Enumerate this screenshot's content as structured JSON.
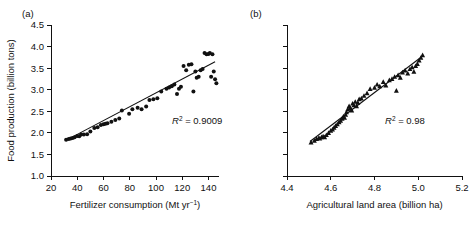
{
  "figure": {
    "panel_a_label": "(a)",
    "panel_b_label": "(b)"
  },
  "chart_data": [
    {
      "type": "scatter",
      "panel": "(a)",
      "title": "",
      "xlabel": "Fertilizer consumption (Mt yr−1)",
      "ylabel": "Food production (billion tons)",
      "xlim": [
        20,
        148
      ],
      "ylim": [
        1.0,
        4.5
      ],
      "xticks": [
        20,
        40,
        60,
        80,
        100,
        120,
        140
      ],
      "xtick_labels": [
        "20",
        "40",
        "60",
        "80",
        "100",
        "120",
        "140"
      ],
      "yticks": [
        1.0,
        1.5,
        2.0,
        2.5,
        3.0,
        3.5,
        4.0,
        4.5
      ],
      "ytick_labels": [
        "1.0",
        "1.5",
        "2.0",
        "2.5",
        "3.0",
        "3.5",
        "4.0",
        "4.5"
      ],
      "grid": false,
      "legend": false,
      "marker": "circle",
      "annotation": "R2 = 0.9009",
      "annotation_r": "R",
      "annotation_sup": "2",
      "annotation_rest": " = 0.9009",
      "r_squared": 0.9009,
      "fit_line": {
        "x0": 31,
        "y0": 1.82,
        "x1": 145,
        "y1": 3.65
      },
      "x": [
        31.5,
        33.5,
        35.0,
        36.5,
        38.0,
        40.0,
        41.5,
        43.0,
        45.0,
        47.5,
        50.0,
        53.0,
        55.5,
        58.0,
        60.0,
        61.5,
        63.0,
        66.0,
        69.0,
        72.0,
        74.0,
        79.5,
        82.0,
        86.0,
        89.0,
        92.5,
        95.0,
        98.0,
        101.0,
        104.0,
        108.0,
        110.0,
        112.0,
        114.0,
        116.0,
        117.5,
        119.0,
        121.0,
        123.0,
        125.0,
        127.0,
        128.5,
        130.0,
        131.0,
        132.5,
        134.0,
        135.5,
        137.0,
        138.5,
        140.0,
        141.0,
        142.0,
        143.0,
        144.0,
        145.0,
        146.0
      ],
      "y": [
        1.84,
        1.86,
        1.87,
        1.88,
        1.9,
        1.93,
        1.92,
        1.96,
        1.96,
        1.97,
        2.03,
        2.11,
        2.13,
        2.18,
        2.2,
        2.21,
        2.22,
        2.26,
        2.3,
        2.33,
        2.52,
        2.44,
        2.55,
        2.58,
        2.55,
        2.61,
        2.76,
        2.78,
        2.8,
        2.96,
        3.02,
        3.05,
        3.08,
        3.12,
        2.9,
        3.02,
        3.07,
        3.55,
        3.45,
        3.58,
        3.59,
        2.96,
        3.42,
        3.28,
        3.3,
        3.45,
        3.48,
        3.85,
        3.82,
        3.83,
        3.85,
        3.3,
        3.82,
        3.42,
        3.24,
        3.15
      ]
    },
    {
      "type": "scatter",
      "panel": "(b)",
      "title": "",
      "xlabel": "Agricultural land area (billion ha)",
      "ylabel": "",
      "xlim": [
        4.4,
        5.2
      ],
      "ylim": [
        1.0,
        4.5
      ],
      "xticks": [
        4.4,
        4.6,
        4.8,
        5.0,
        5.2
      ],
      "xtick_labels": [
        "4.4",
        "4.6",
        "4.8",
        "5.0",
        "5.2"
      ],
      "yticks": [
        1.0,
        1.5,
        2.0,
        2.5,
        3.0,
        3.5,
        4.0,
        4.5
      ],
      "ytick_labels": [
        "",
        "",
        "",
        "",
        "",
        "",
        "",
        ""
      ],
      "grid": false,
      "legend": false,
      "marker": "triangle",
      "annotation": "R2 = 0.98",
      "annotation_r": "R",
      "annotation_sup": "2",
      "annotation_rest": " = 0.98",
      "r_squared": 0.98,
      "fit_line": {
        "x0": 4.505,
        "y0": 1.8,
        "x1": 5.025,
        "y1": 3.8
      },
      "x": [
        4.51,
        4.525,
        4.535,
        4.545,
        4.55,
        4.558,
        4.565,
        4.572,
        4.58,
        4.59,
        4.6,
        4.608,
        4.615,
        4.622,
        4.63,
        4.638,
        4.645,
        4.652,
        4.658,
        4.663,
        4.668,
        4.672,
        4.678,
        4.684,
        4.69,
        4.696,
        4.7,
        4.706,
        4.712,
        4.718,
        4.724,
        4.73,
        4.74,
        4.752,
        4.766,
        4.78,
        4.8,
        4.812,
        4.824,
        4.84,
        4.852,
        4.868,
        4.88,
        4.892,
        4.9,
        4.908,
        4.918,
        4.928,
        4.94,
        4.952,
        4.962,
        4.972,
        4.98,
        4.988,
        4.996,
        5.004,
        5.012,
        5.02
      ],
      "y": [
        1.78,
        1.82,
        1.86,
        1.88,
        1.87,
        1.9,
        1.92,
        1.9,
        1.95,
        2.0,
        2.05,
        2.08,
        2.12,
        2.16,
        2.2,
        2.25,
        2.28,
        2.33,
        2.38,
        2.35,
        2.42,
        2.48,
        2.55,
        2.62,
        2.58,
        2.52,
        2.68,
        2.64,
        2.72,
        2.62,
        2.7,
        2.78,
        2.8,
        2.86,
        2.92,
        3.02,
        3.05,
        3.12,
        3.08,
        3.18,
        3.1,
        3.22,
        3.25,
        3.3,
        2.98,
        3.34,
        3.28,
        3.4,
        3.45,
        3.38,
        3.48,
        3.52,
        3.42,
        3.55,
        3.6,
        3.68,
        3.74,
        3.8
      ]
    }
  ]
}
